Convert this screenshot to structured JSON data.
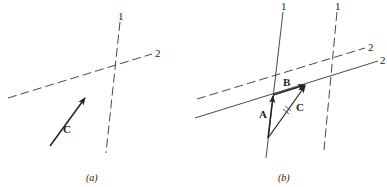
{
  "panels": [
    {
      "id": "a",
      "caption": "(a)",
      "lines": [
        {
          "label": "1",
          "style": "dashed"
        },
        {
          "label": "2",
          "style": "dashed"
        }
      ],
      "vectors": [
        {
          "label": "C"
        }
      ]
    },
    {
      "id": "b",
      "caption": "(b)",
      "lines": [
        {
          "label": "1",
          "style": "solid"
        },
        {
          "label": "1",
          "style": "dashed"
        },
        {
          "label": "2",
          "style": "dashed"
        },
        {
          "label": "2",
          "style": "solid"
        }
      ],
      "vectors": [
        {
          "label": "A"
        },
        {
          "label": "B"
        },
        {
          "label": "C",
          "mark": "double-hatch"
        }
      ]
    }
  ]
}
